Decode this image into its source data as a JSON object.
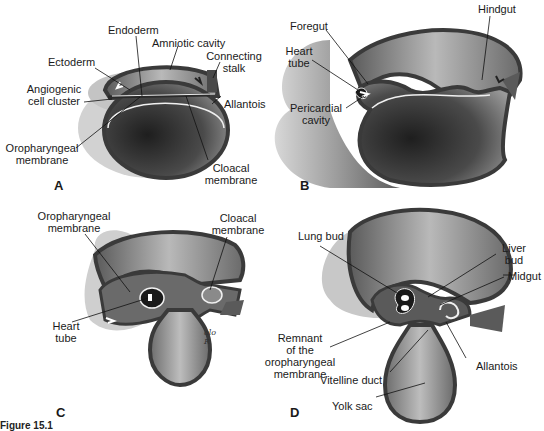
{
  "figure": {
    "caption_visible": "Figure 15.1",
    "colors": {
      "background": "#ffffff",
      "outer_layer_light": "#cfcfcf",
      "amnion_mid": "#8a8a8a",
      "wall_dark": "#3a3a3a",
      "yolk_sac_dark": "#2a2a2a",
      "endoderm_line": "#f2f2f2",
      "label_text": "#1a1a1a",
      "leader_line": "#111111"
    }
  },
  "panels": {
    "A": {
      "letter": "A",
      "labels": {
        "endoderm": "Endoderm",
        "amniotic_cavity": "Amniotic cavity",
        "ectoderm": "Ectoderm",
        "connecting_stalk_1": "Connecting",
        "connecting_stalk_2": "stalk",
        "angiogenic_1": "Angiogenic",
        "angiogenic_2": "cell cluster",
        "allantois": "Allantois",
        "oropharyngeal_1": "Oropharyngeal",
        "oropharyngeal_2": "membrane",
        "cloacal_1": "Cloacal",
        "cloacal_2": "membrane"
      }
    },
    "B": {
      "letter": "B",
      "labels": {
        "foregut": "Foregut",
        "hindgut": "Hindgut",
        "heart_tube_1": "Heart",
        "heart_tube_2": "tube",
        "pericardial_1": "Pericardial",
        "pericardial_2": "cavity"
      }
    },
    "C": {
      "letter": "C",
      "signature": "alo R",
      "labels": {
        "oropharyngeal_1": "Oropharyngeal",
        "oropharyngeal_2": "membrane",
        "cloacal_1": "Cloacal",
        "cloacal_2": "membrane",
        "heart_tube_1": "Heart",
        "heart_tube_2": "tube"
      }
    },
    "D": {
      "letter": "D",
      "labels": {
        "lung_bud": "Lung bud",
        "liver_bud_1": "Liver",
        "liver_bud_2": "bud",
        "midgut": "Midgut",
        "remnant_1": "Remnant",
        "remnant_2": "of the",
        "remnant_3": "oropharyngeal",
        "remnant_4": "membrane",
        "allantois": "Allantois",
        "vitelline_duct": "Vitelline duct",
        "yolk_sac": "Yolk sac"
      }
    }
  }
}
